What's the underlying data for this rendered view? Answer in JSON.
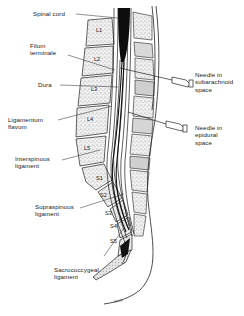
{
  "figure": {
    "labels_left": [
      {
        "id": "spinal-cord",
        "text": "Spinal cord"
      },
      {
        "id": "filum-terminale",
        "text": "Filum\nterminale"
      },
      {
        "id": "dura",
        "text": "Dura"
      },
      {
        "id": "ligamentum-flavum",
        "text": "Ligamentum\nflavum"
      },
      {
        "id": "interspinous-ligament",
        "text": "Interspinous\nligament"
      },
      {
        "id": "supraspinous-ligament",
        "text": "Supraspinous\nligament"
      },
      {
        "id": "sacrococcygeal-ligament",
        "text": "Sacrococcygeal\nligament"
      }
    ],
    "labels_right": [
      {
        "id": "needle-subarachnoid",
        "text": "Needle in\nsubarachnoid\nspace"
      },
      {
        "id": "needle-epidural",
        "text": "Needle in\nepidural\nspace"
      }
    ],
    "vertebrae": {
      "lumbar": [
        "L1",
        "L2",
        "L3",
        "L4",
        "L5"
      ],
      "sacral": [
        "S1",
        "S2",
        "S3",
        "S4",
        "S5"
      ]
    },
    "signature": "Smith"
  },
  "colors": {
    "ink": "#1a1a1a",
    "background": "#ffffff",
    "cord": "#0d0d0d",
    "bone_fill": "#e9e9e9"
  }
}
